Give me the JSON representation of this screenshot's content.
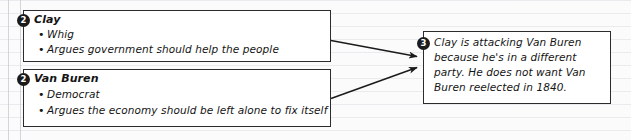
{
  "diagram": {
    "type": "cause-effect-notes",
    "boxes": [
      {
        "id": "clay-box",
        "number": "2",
        "title": "Clay",
        "bullets": [
          "Whig",
          "Argues government should help the people"
        ]
      },
      {
        "id": "van-buren-box",
        "number": "2",
        "title": "Van Buren",
        "bullets": [
          "Democrat",
          "Argues the economy should be left alone to fix itself"
        ]
      }
    ],
    "conclusion": {
      "id": "conclusion-box",
      "number": "3",
      "lines": [
        "Clay is attacking Van Buren",
        "because he's in a different",
        "party. He does not want Van",
        "Buren reelected in 1840."
      ]
    },
    "bullet_glyph": "•",
    "colors": {
      "ink": "#141414",
      "box_border": "#2c2c2c",
      "circle_fill": "#1b1b1b",
      "circle_text": "#ffffff",
      "page_background": "#fbfbfb",
      "rule_line": "#c4c9d2"
    }
  }
}
